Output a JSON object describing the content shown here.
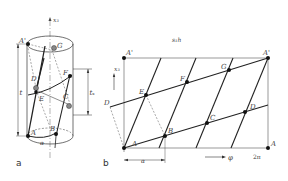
{
  "figure": {
    "panel_a": {
      "caption": "a",
      "axis_label": "x₃",
      "points": [
        "A'",
        "G",
        "D",
        "F",
        "E",
        "C",
        "A",
        "B"
      ],
      "dimension_left": "t",
      "dimension_right": "tₛ",
      "angle_label": "α"
    },
    "panel_b": {
      "caption": "b",
      "title": "s₁h",
      "axis_label": "x₃",
      "x_axis_label": "φ",
      "x_end_label": "2π",
      "angle_dim_label": "α",
      "corner_labels": {
        "top_left": "A'",
        "top_right": "A'",
        "bottom_left": "A",
        "bottom_right": "A"
      },
      "points": {
        "D_left": "D",
        "E": "E",
        "F": "F",
        "G": "G",
        "B": "B",
        "C": "C",
        "D_right": "D"
      }
    },
    "colors": {
      "line": "#222222",
      "thin_line": "#555555",
      "point": "#111111",
      "grey_point": "#888888"
    }
  }
}
